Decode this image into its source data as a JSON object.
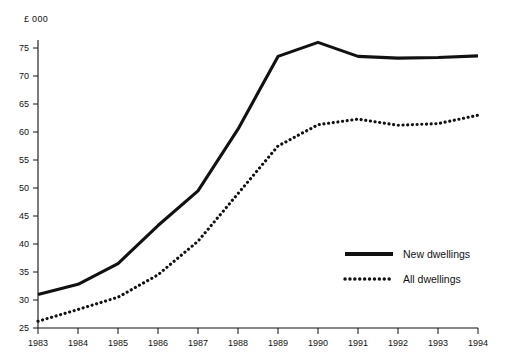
{
  "chart_data": {
    "type": "line",
    "title": "",
    "subtitle": "",
    "xlabel": "",
    "ylabel": "£ 000",
    "unit_label": "£ 000",
    "categories": [
      "1983",
      "1984",
      "1985",
      "1986",
      "1987",
      "1988",
      "1989",
      "1990",
      "1991",
      "1992",
      "1993",
      "1994"
    ],
    "x": [
      1983,
      1984,
      1985,
      1986,
      1987,
      1988,
      1989,
      1990,
      1991,
      1992,
      1993,
      1994
    ],
    "xlim": [
      1983,
      1994
    ],
    "ylim": [
      22,
      77
    ],
    "ytick_labels": [
      "25",
      "30",
      "35",
      "40",
      "45",
      "50",
      "55",
      "60",
      "65",
      "70",
      "75"
    ],
    "yticks": [
      25,
      30,
      35,
      40,
      45,
      50,
      55,
      60,
      65,
      70,
      75
    ],
    "xtick_labels": [
      "1983",
      "1984",
      "1985",
      "1986",
      "1987",
      "1988",
      "1989",
      "1990",
      "1991",
      "1992",
      "1993",
      "1994"
    ],
    "grid": false,
    "legend_position": "inside-right-lower",
    "series": [
      {
        "name": "New dwellings",
        "style": "solid",
        "color": "#111111",
        "values": [
          31.0,
          32.8,
          36.5,
          43.3,
          49.5,
          60.5,
          73.5,
          76.0,
          73.5,
          73.2,
          73.3,
          73.6
        ]
      },
      {
        "name": "All dwellings",
        "style": "dotted",
        "color": "#111111",
        "values": [
          26.2,
          28.3,
          30.5,
          34.5,
          40.5,
          49.0,
          57.5,
          61.3,
          62.3,
          61.2,
          61.5,
          63.0
        ]
      }
    ],
    "legend": [
      {
        "label": "New dwellings",
        "style": "solid"
      },
      {
        "label": "All dwellings",
        "style": "dotted"
      }
    ]
  }
}
